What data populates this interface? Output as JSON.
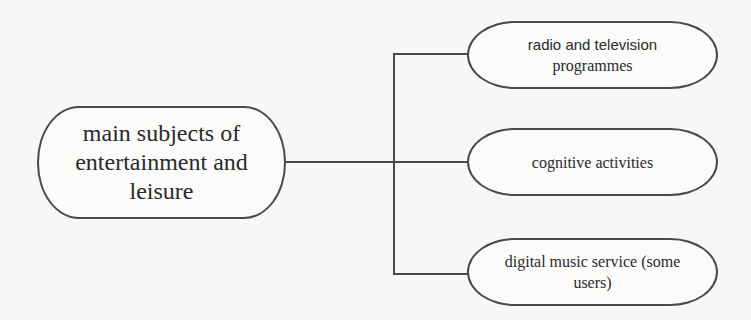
{
  "diagram": {
    "type": "tree",
    "root": {
      "label": "main subjects of entertainment and leisure"
    },
    "children": [
      {
        "label_line1": "radio and television",
        "label_line2": "programmes"
      },
      {
        "label_line1": "cognitive activities"
      },
      {
        "label_line1": "digital music service (some",
        "label_line2": "users)"
      }
    ],
    "colors": {
      "stroke": "#4a4a4a",
      "background": "#f7f7f5",
      "text": "#2a2a2a"
    }
  }
}
